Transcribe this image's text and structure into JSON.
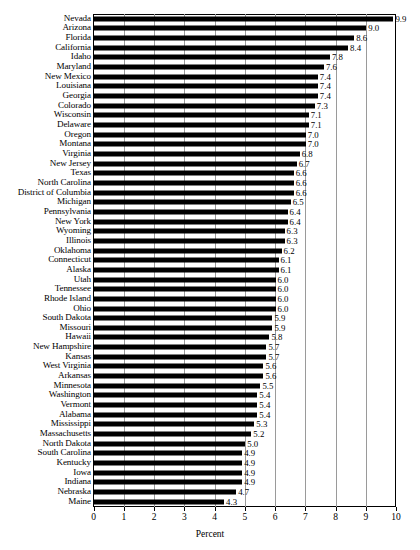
{
  "chart_data": {
    "type": "bar",
    "orientation": "horizontal",
    "title": "",
    "xlabel": "Percent",
    "ylabel": "",
    "xlim": [
      0,
      10
    ],
    "xticks": [
      0,
      1,
      2,
      3,
      4,
      5,
      6,
      7,
      8,
      9,
      10
    ],
    "xtick_labels": [
      "0",
      "1",
      "2",
      "3",
      "4",
      "5",
      "6",
      "7",
      "8",
      "9",
      "10"
    ],
    "grid": true,
    "grid_axis": "x",
    "legend": null,
    "bar_color": "#000000",
    "frame_color": "#000000",
    "gridline_color": "#9a9a9a",
    "categories": [
      "Nevada",
      "Arizona",
      "Florida",
      "California",
      "Idaho",
      "Maryland",
      "New Mexico",
      "Louisiana",
      "Georgia",
      "Colorado",
      "Wisconsin",
      "Delaware",
      "Oregon",
      "Montana",
      "Virginia",
      "New Jersey",
      "Texas",
      "North Carolina",
      "District of Columbia",
      "Michigan",
      "Pennsylvania",
      "New York",
      "Wyoming",
      "Illinois",
      "Oklahoma",
      "Connecticut",
      "Alaska",
      "Utah",
      "Tennessee",
      "Rhode Island",
      "Ohio",
      "South Dakota",
      "Missouri",
      "Hawaii",
      "New Hampshire",
      "Kansas",
      "West Virginia",
      "Arkansas",
      "Minnesota",
      "Washington",
      "Vermont",
      "Alabama",
      "Mississippi",
      "Massachusetts",
      "North Dakota",
      "South Carolina",
      "Kentucky",
      "Iowa",
      "Indiana",
      "Nebraska",
      "Maine"
    ],
    "values": [
      9.9,
      9.0,
      8.6,
      8.4,
      7.8,
      7.6,
      7.4,
      7.4,
      7.4,
      7.3,
      7.1,
      7.1,
      7.0,
      7.0,
      6.8,
      6.7,
      6.6,
      6.6,
      6.6,
      6.5,
      6.4,
      6.4,
      6.3,
      6.3,
      6.2,
      6.1,
      6.1,
      6.0,
      6.0,
      6.0,
      6.0,
      5.9,
      5.9,
      5.8,
      5.7,
      5.7,
      5.6,
      5.6,
      5.5,
      5.4,
      5.4,
      5.4,
      5.3,
      5.2,
      5.0,
      4.9,
      4.9,
      4.9,
      4.9,
      4.7,
      4.3
    ],
    "value_labels": [
      "9.9",
      "9.0",
      "8.6",
      "8.4",
      "7.8",
      "7.6",
      "7.4",
      "7.4",
      "7.4",
      "7.3",
      "7.1",
      "7.1",
      "7.0",
      "7.0",
      "6.8",
      "6.7",
      "6.6",
      "6.6",
      "6.6",
      "6.5",
      "6.4",
      "6.4",
      "6.3",
      "6.3",
      "6.2",
      "6.1",
      "6.1",
      "6.0",
      "6.0",
      "6.0",
      "6.0",
      "5.9",
      "5.9",
      "5.8",
      "5.7",
      "5.7",
      "5.6",
      "5.6",
      "5.5",
      "5.4",
      "5.4",
      "5.4",
      "5.3",
      "5.2",
      "5.0",
      "4.9",
      "4.9",
      "4.9",
      "4.9",
      "4.7",
      "4.3"
    ]
  }
}
